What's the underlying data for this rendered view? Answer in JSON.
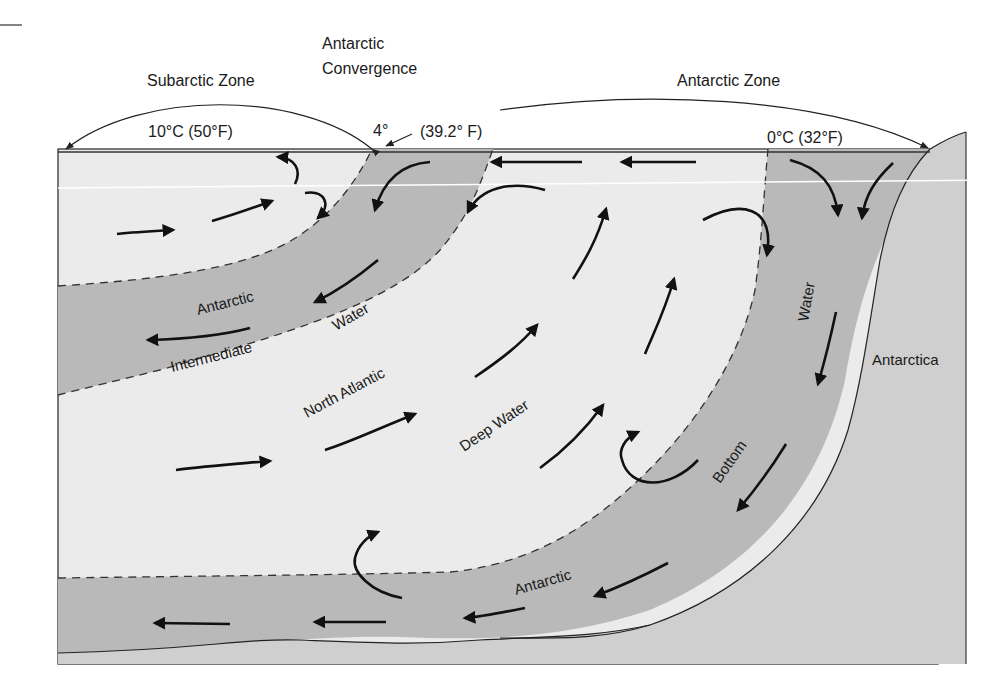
{
  "diagram": {
    "colors": {
      "light_water": "#ebebeb",
      "dark_water": "#b9b9b9",
      "land": "#cfcfcf",
      "outline": "#333333",
      "arrow": "#111111",
      "text": "#1a1a1a"
    },
    "top_labels": {
      "subarctic_zone": "Subarctic Zone",
      "antarctic_convergence_line1": "Antarctic",
      "antarctic_convergence_line2": "Convergence",
      "antarctic_zone": "Antarctic Zone",
      "temp_subarctic": "10°C (50°F)",
      "temp_convergence": "4°",
      "temp_convergence_f": "(39.2° F)",
      "temp_antarctic": "0°C (32°F)"
    },
    "water_masses": [
      {
        "id": "antarctic-intermediate-water",
        "words": [
          "Antarctic",
          "Intermediate",
          "Water"
        ]
      },
      {
        "id": "north-atlantic-deep-water",
        "words": [
          "North Atlantic",
          "Deep Water"
        ]
      },
      {
        "id": "antarctic-bottom-water",
        "words": [
          "Antarctic",
          "Bottom",
          "Water"
        ]
      }
    ],
    "landmass": {
      "label": "Antarctica"
    }
  }
}
